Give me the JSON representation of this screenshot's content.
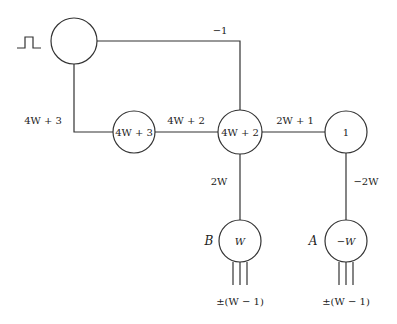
{
  "diagram": {
    "type": "threshold-gadget-network",
    "input_symbol": "pulse-icon",
    "nodes": [
      {
        "id": "source",
        "label": ""
      },
      {
        "id": "n1",
        "label": "4W + 3"
      },
      {
        "id": "n2",
        "label": "4W + 2"
      },
      {
        "id": "n3",
        "label": "1"
      },
      {
        "id": "B",
        "label": "W",
        "name": "B"
      },
      {
        "id": "A",
        "label": "−W",
        "name": "A"
      }
    ],
    "edges": [
      {
        "from": "source",
        "to": "n2",
        "weight": "−1"
      },
      {
        "from": "source",
        "to": "n1",
        "weight": "4W + 3"
      },
      {
        "from": "n1",
        "to": "n2",
        "weight": "4W + 2"
      },
      {
        "from": "n2",
        "to": "n3",
        "weight": "2W + 1"
      },
      {
        "from": "n2",
        "to": "B",
        "weight": "2W"
      },
      {
        "from": "n3",
        "to": "A",
        "weight": "−2W"
      }
    ],
    "outputs": {
      "B": "±(W − 1)",
      "A": "±(W − 1)"
    }
  }
}
